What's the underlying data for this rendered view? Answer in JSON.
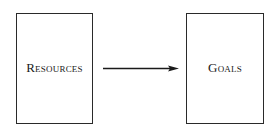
{
  "diagram": {
    "nodes": [
      {
        "id": "resources",
        "label": "Resources"
      },
      {
        "id": "goals",
        "label": "Goals"
      }
    ],
    "edges": [
      {
        "from": "resources",
        "to": "goals",
        "type": "arrow"
      }
    ]
  }
}
